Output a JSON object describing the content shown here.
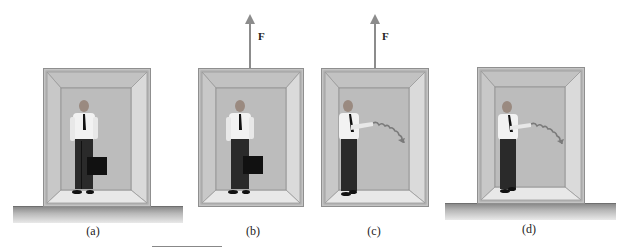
{
  "figure": {
    "panels": [
      {
        "id": "a",
        "label": "(a)",
        "force_label": null,
        "has_briefcase": true,
        "has_ground": true,
        "person_action": "holding briefcase"
      },
      {
        "id": "b",
        "label": "(b)",
        "force_label": "F",
        "has_briefcase": true,
        "has_ground": false,
        "person_action": "holding briefcase"
      },
      {
        "id": "c",
        "label": "(c)",
        "force_label": "F",
        "has_briefcase": false,
        "has_ground": false,
        "person_action": "throwing object with curved trajectory"
      },
      {
        "id": "d",
        "label": "(d)",
        "force_label": null,
        "has_briefcase": false,
        "has_ground": true,
        "person_action": "throwing object with curved trajectory"
      }
    ],
    "colors": {
      "frame": "#9a9a9a",
      "back_wall": "#bdbdbd",
      "side_wall": "#cfcfcf",
      "floor": "#e6e6e6",
      "arrow": "#8c8c8c",
      "ground_top": "#8a8a8a"
    }
  }
}
